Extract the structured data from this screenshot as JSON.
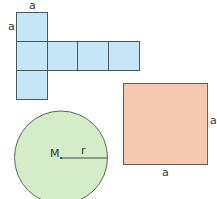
{
  "colors": {
    "net_fill": "#c6e6f7",
    "net_stroke": "#4a5560",
    "square_fill": "#f4c9b0",
    "square_stroke": "#6b5a55",
    "circle_fill": "#d5ecc8",
    "circle_stroke": "#5a6a5a"
  },
  "net": {
    "label_top": "a",
    "label_left": "a"
  },
  "square": {
    "label_right": "a",
    "label_bottom": "a"
  },
  "circle": {
    "center_label": "M",
    "radius_label": "r"
  }
}
